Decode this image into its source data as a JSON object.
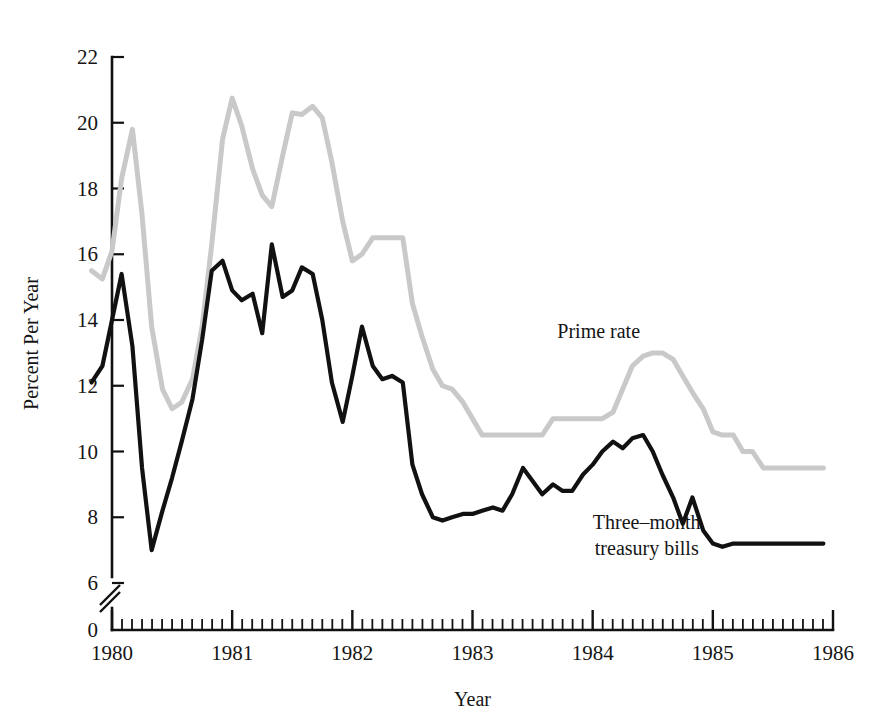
{
  "chart_data": {
    "type": "line",
    "title": "",
    "xlabel": "Year",
    "ylabel": "Percent Per Year",
    "xlim": [
      1979.8,
      1986.0
    ],
    "ylim": [
      0,
      22
    ],
    "y_axis_break": true,
    "y_break_between": [
      0,
      6
    ],
    "y_data_min": 6,
    "grid": false,
    "legend": "inline-annotations",
    "ytick_labels": [
      "0",
      "6",
      "8",
      "10",
      "12",
      "14",
      "16",
      "18",
      "20",
      "22"
    ],
    "ytick_values": [
      0,
      6,
      8,
      10,
      12,
      14,
      16,
      18,
      20,
      22
    ],
    "xtick_labels": [
      "1980",
      "1981",
      "1982",
      "1983",
      "1984",
      "1985",
      "1986"
    ],
    "xtick_values": [
      1980,
      1981,
      1982,
      1983,
      1984,
      1985,
      1986
    ],
    "x_minor_ticks_per_year": 12,
    "series": [
      {
        "name": "Prime rate",
        "color": "#c9c9c9",
        "width": 5.0,
        "label_x": 1984.05,
        "label_y": 13.45,
        "x": [
          1979.83,
          1979.92,
          1980.0,
          1980.08,
          1980.17,
          1980.25,
          1980.33,
          1980.42,
          1980.5,
          1980.58,
          1980.67,
          1980.75,
          1980.83,
          1980.92,
          1981.0,
          1981.08,
          1981.17,
          1981.25,
          1981.33,
          1981.42,
          1981.5,
          1981.58,
          1981.67,
          1981.75,
          1981.83,
          1981.92,
          1982.0,
          1982.08,
          1982.17,
          1982.25,
          1982.33,
          1982.42,
          1982.5,
          1982.58,
          1982.67,
          1982.75,
          1982.83,
          1982.92,
          1983.0,
          1983.08,
          1983.17,
          1983.25,
          1983.33,
          1983.42,
          1983.5,
          1983.58,
          1983.67,
          1983.75,
          1983.83,
          1983.92,
          1984.0,
          1984.08,
          1984.17,
          1984.25,
          1984.33,
          1984.42,
          1984.5,
          1984.58,
          1984.67,
          1984.75,
          1984.83,
          1984.92,
          1985.0,
          1985.08,
          1985.17,
          1985.25,
          1985.33,
          1985.42,
          1985.5,
          1985.58,
          1985.67,
          1985.75,
          1985.83,
          1985.92
        ],
        "y": [
          15.5,
          15.25,
          16.1,
          18.3,
          19.8,
          17.2,
          13.8,
          11.9,
          11.3,
          11.5,
          12.2,
          13.8,
          16.3,
          19.5,
          20.75,
          19.9,
          18.6,
          17.8,
          17.45,
          19.0,
          20.3,
          20.25,
          20.5,
          20.15,
          18.8,
          17.0,
          15.8,
          16.0,
          16.5,
          16.5,
          16.5,
          16.5,
          14.5,
          13.5,
          12.5,
          12.0,
          11.9,
          11.5,
          11.0,
          10.5,
          10.5,
          10.5,
          10.5,
          10.5,
          10.5,
          10.5,
          11.0,
          11.0,
          11.0,
          11.0,
          11.0,
          11.0,
          11.2,
          11.9,
          12.6,
          12.9,
          13.0,
          13.0,
          12.8,
          12.3,
          11.8,
          11.3,
          10.6,
          10.5,
          10.5,
          10.0,
          10.0,
          9.5,
          9.5,
          9.5,
          9.5,
          9.5,
          9.5,
          9.5
        ]
      },
      {
        "name": "Three-month treasury bills",
        "color": "#111111",
        "width": 4.2,
        "label_x": 1984.45,
        "label_y": 7.65,
        "label_line2_offset": 1.0,
        "x": [
          1979.83,
          1979.92,
          1980.0,
          1980.08,
          1980.17,
          1980.25,
          1980.33,
          1980.42,
          1980.5,
          1980.58,
          1980.67,
          1980.75,
          1980.83,
          1980.92,
          1981.0,
          1981.08,
          1981.17,
          1981.25,
          1981.33,
          1981.42,
          1981.5,
          1981.58,
          1981.67,
          1981.75,
          1981.83,
          1981.92,
          1982.0,
          1982.08,
          1982.17,
          1982.25,
          1982.33,
          1982.42,
          1982.5,
          1982.58,
          1982.67,
          1982.75,
          1982.83,
          1982.92,
          1983.0,
          1983.08,
          1983.17,
          1983.25,
          1983.33,
          1983.42,
          1983.5,
          1983.58,
          1983.67,
          1983.75,
          1983.83,
          1983.92,
          1984.0,
          1984.08,
          1984.17,
          1984.25,
          1984.33,
          1984.42,
          1984.5,
          1984.58,
          1984.67,
          1984.75,
          1984.83,
          1984.92,
          1985.0,
          1985.08,
          1985.17,
          1985.25,
          1985.33,
          1985.42,
          1985.5,
          1985.58,
          1985.67,
          1985.75,
          1985.83,
          1985.92
        ],
        "y": [
          12.1,
          12.6,
          14.0,
          15.4,
          13.2,
          9.5,
          7.0,
          8.2,
          9.2,
          10.3,
          11.6,
          13.4,
          15.5,
          15.8,
          14.9,
          14.6,
          14.8,
          13.6,
          16.3,
          14.7,
          14.9,
          15.6,
          15.4,
          14.0,
          12.1,
          10.9,
          12.3,
          13.8,
          12.6,
          12.2,
          12.3,
          12.1,
          9.6,
          8.7,
          8.0,
          7.9,
          8.0,
          8.1,
          8.1,
          8.2,
          8.3,
          8.2,
          8.7,
          9.5,
          9.1,
          8.7,
          9.0,
          8.8,
          8.8,
          9.3,
          9.6,
          10.0,
          10.3,
          10.1,
          10.4,
          10.5,
          10.0,
          9.3,
          8.6,
          7.8,
          8.6,
          7.6,
          7.2,
          7.1,
          7.2,
          7.2,
          7.2,
          7.2,
          7.2,
          7.2,
          7.2,
          7.2,
          7.2,
          7.2
        ]
      }
    ]
  },
  "annotations": {
    "prime_rate_label": "Prime rate",
    "tbill_label_line1": "Three–month",
    "tbill_label_line2": "treasury bills"
  },
  "axes": {
    "y_title": "Percent Per Year",
    "x_title": "Year"
  },
  "colors": {
    "prime": "#c9c9c9",
    "tbill": "#111111",
    "axis": "#111111",
    "background": "#ffffff"
  }
}
